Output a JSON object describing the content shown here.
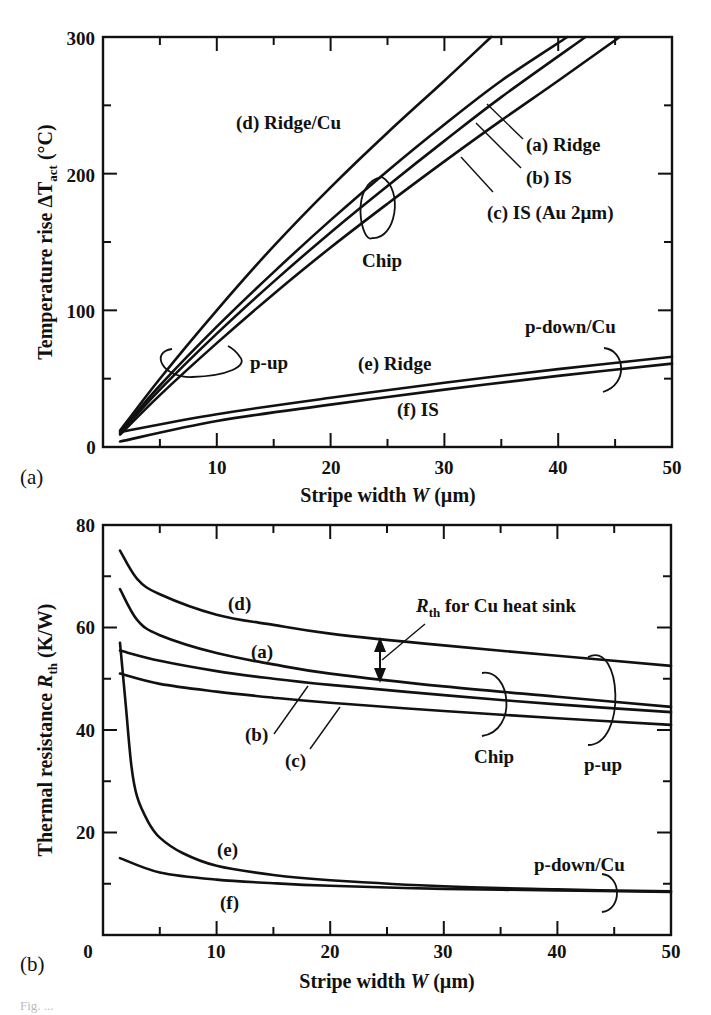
{
  "chart_data": [
    {
      "id": "a",
      "type": "line",
      "panel_label": "(a)",
      "title": "",
      "xlabel": "Stripe width W (µm)",
      "ylabel": "Temperature rise ΔT_act (°C)",
      "xlim": [
        0,
        50
      ],
      "ylim": [
        0,
        300
      ],
      "xticks": [
        0,
        10,
        20,
        30,
        40,
        50
      ],
      "yticks": [
        100,
        200,
        300
      ],
      "grid": false,
      "series": [
        {
          "name": "(d) Ridge/Cu",
          "x": [
            1.5,
            5,
            10,
            15,
            20,
            25,
            30,
            34.1
          ],
          "y": [
            12,
            50,
            100,
            147,
            190,
            230,
            268,
            300
          ]
        },
        {
          "name": "(a) Ridge",
          "x": [
            1.5,
            5,
            10,
            15,
            20,
            25,
            30,
            35,
            40.8
          ],
          "y": [
            11,
            45,
            88,
            128,
            166,
            202,
            236,
            268,
            300
          ]
        },
        {
          "name": "(b) IS",
          "x": [
            1.5,
            5,
            10,
            15,
            20,
            25,
            30,
            35,
            42.4
          ],
          "y": [
            10,
            42,
            83,
            121,
            157,
            191,
            224,
            256,
            300
          ]
        },
        {
          "name": "(c) IS (Au 2µm)",
          "x": [
            1.5,
            5,
            10,
            15,
            20,
            25,
            30,
            35,
            40,
            45.4
          ],
          "y": [
            9,
            38,
            76,
            112,
            146,
            178,
            209,
            239,
            268,
            300
          ]
        },
        {
          "name": "(e) Ridge",
          "x": [
            1.5,
            10,
            20,
            30,
            40,
            50
          ],
          "y": [
            11,
            24,
            36,
            47,
            57,
            66
          ]
        },
        {
          "name": "(f) IS",
          "x": [
            1.5,
            10,
            20,
            30,
            40,
            50
          ],
          "y": [
            4,
            19,
            31,
            42,
            52,
            61
          ]
        }
      ],
      "annotations": [
        "(d) Ridge/Cu",
        "(a) Ridge",
        "(b) IS",
        "(c) IS (Au 2µm)",
        "Chip",
        "p-up",
        "(e) Ridge",
        "(f) IS",
        "p-down/Cu"
      ]
    },
    {
      "id": "b",
      "type": "line",
      "panel_label": "(b)",
      "title": "",
      "xlabel": "Stripe width W (µm)",
      "ylabel": "Thermal resistance R_th (K/W)",
      "xlim": [
        0,
        50
      ],
      "ylim": [
        0,
        80
      ],
      "xticks": [
        0,
        10,
        20,
        30,
        40,
        50
      ],
      "yticks": [
        20,
        40,
        60,
        80
      ],
      "grid": false,
      "series": [
        {
          "name": "(d)",
          "x": [
            1.5,
            3,
            5,
            10,
            15,
            20,
            30,
            40,
            50
          ],
          "y": [
            75,
            69.5,
            66.5,
            62.5,
            60.5,
            58.8,
            56.5,
            54.5,
            52.5
          ]
        },
        {
          "name": "(a)",
          "x": [
            1.5,
            3,
            5,
            10,
            15,
            20,
            30,
            40,
            50
          ],
          "y": [
            67.5,
            61.5,
            58.5,
            55,
            52.8,
            51,
            48.5,
            46.5,
            44.5
          ]
        },
        {
          "name": "(b)",
          "x": [
            1.5,
            5,
            10,
            15,
            20,
            30,
            40,
            50
          ],
          "y": [
            55.5,
            53.5,
            51.5,
            50,
            48.8,
            46.8,
            45,
            43.5
          ]
        },
        {
          "name": "(c)",
          "x": [
            1.5,
            5,
            10,
            15,
            20,
            30,
            40,
            50
          ],
          "y": [
            51,
            49,
            47.5,
            46.3,
            45.3,
            43.7,
            42.3,
            41
          ]
        },
        {
          "name": "(e)",
          "x": [
            1.5,
            2,
            2.5,
            3,
            4,
            5,
            7,
            10,
            15,
            20,
            30,
            40,
            50
          ],
          "y": [
            57,
            45,
            33,
            27,
            22,
            19,
            16,
            13.5,
            11.7,
            10.7,
            9.5,
            8.9,
            8.5
          ]
        },
        {
          "name": "(f)",
          "x": [
            1.5,
            5,
            10,
            15,
            20,
            30,
            40,
            50
          ],
          "y": [
            15,
            12.2,
            10.8,
            10.1,
            9.6,
            9,
            8.7,
            8.4
          ]
        }
      ],
      "annotations": [
        "(d)",
        "(a)",
        "(b)",
        "(c)",
        "R_th for Cu heat sink",
        "Chip",
        "p-up",
        "(e)",
        "(f)",
        "p-down/Cu"
      ]
    }
  ],
  "panel_a": {
    "panel_label": "(a)",
    "ylabel_main": "Temperature rise  ΔT",
    "ylabel_sub": "act",
    "ylabel_unit": " (°C)",
    "xlabel": "Stripe width ",
    "xlabel_var": "W",
    "xlabel_unit": " (µm)",
    "x_tick_labels": [
      "0",
      "10",
      "20",
      "30",
      "40",
      "50"
    ],
    "y_tick_labels": [
      "100",
      "200",
      "300"
    ],
    "labels": {
      "d": "(d) Ridge/Cu",
      "a": "(a) Ridge",
      "b": "(b) IS",
      "c": "(c) IS (Au 2µm)",
      "chip": "Chip",
      "pup": "p-up",
      "e": "(e) Ridge",
      "f": "(f) IS",
      "pdown": "p-down/Cu"
    }
  },
  "panel_b": {
    "panel_label": "(b)",
    "ylabel_main": "Thermal resistance  ",
    "ylabel_var": "R",
    "ylabel_sub": "th",
    "ylabel_unit": " (K/W)",
    "xlabel": "Stripe width ",
    "xlabel_var": "W",
    "xlabel_unit": " (µm)",
    "x_tick_labels": [
      "0",
      "10",
      "20",
      "30",
      "40",
      "50"
    ],
    "y_tick_labels": [
      "20",
      "40",
      "60",
      "80"
    ],
    "labels": {
      "d": "(d)",
      "a": "(a)",
      "b": "(b)",
      "c": "(c)",
      "rth_var": "R",
      "rth_sub": "th",
      "rth_text": " for Cu heat sink",
      "chip": "Chip",
      "pup": "p-up",
      "e": "(e)",
      "f": "(f)",
      "pdown": "p-down/Cu"
    }
  },
  "caption": "Fig. ..."
}
